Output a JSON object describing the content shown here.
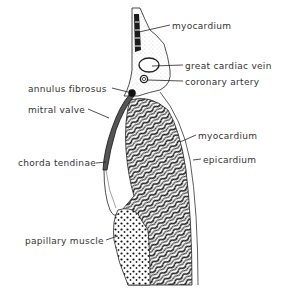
{
  "diagram": {
    "type": "anatomical cross-section",
    "background": "#ffffff",
    "line_color": "#222222",
    "labels": [
      {
        "id": "myocardium-top",
        "text": "myocardium",
        "x": 172,
        "y": 21,
        "side": "right"
      },
      {
        "id": "great-cardiac-vein",
        "text": "great cardiac vein",
        "x": 185,
        "y": 61,
        "side": "right"
      },
      {
        "id": "coronary-artery",
        "text": "coronary artery",
        "x": 185,
        "y": 77,
        "side": "right"
      },
      {
        "id": "annulus-fibrosus",
        "text": "annulus fibrosus",
        "x": 28,
        "y": 84,
        "side": "left"
      },
      {
        "id": "mitral-valve",
        "text": "mitral valve",
        "x": 28,
        "y": 105,
        "side": "left"
      },
      {
        "id": "myocardium-mid",
        "text": "myocardium",
        "x": 198,
        "y": 131,
        "side": "right"
      },
      {
        "id": "epicardium",
        "text": "epicardium",
        "x": 203,
        "y": 155,
        "side": "right"
      },
      {
        "id": "chordae-tendineae",
        "text": "chorda tendinae",
        "x": 18,
        "y": 160,
        "side": "left"
      },
      {
        "id": "papillary-muscle",
        "text": "papillary muscle",
        "x": 25,
        "y": 236,
        "side": "left"
      }
    ]
  }
}
